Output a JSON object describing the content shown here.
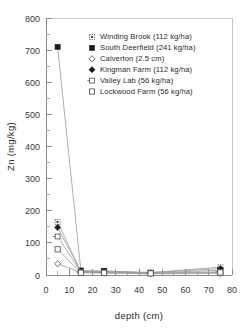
{
  "chart_data": {
    "type": "line",
    "title": "",
    "xlabel": "depth  (cm)",
    "ylabel": "Zn  (mg/kg)",
    "xlim": [
      0,
      80
    ],
    "ylim": [
      0,
      800
    ],
    "xticks": [
      0,
      10,
      20,
      30,
      40,
      50,
      60,
      70,
      80
    ],
    "yticks": [
      0,
      100,
      200,
      300,
      400,
      500,
      600,
      700,
      800
    ],
    "xtick_labels": [
      "0",
      "10",
      "20",
      "30",
      "40",
      "50",
      "60",
      "70",
      "80"
    ],
    "ytick_labels": [
      "0",
      "100",
      "200",
      "300",
      "400",
      "500",
      "600",
      "700",
      "800"
    ],
    "minor_ticks": true,
    "grid": false,
    "legend_position": "upper right inside",
    "x": [
      5,
      15,
      25,
      45,
      75
    ],
    "series": [
      {
        "name": "Winding Brook (112 kg/ha)",
        "marker": "dotted-square",
        "values": [
          165,
          10,
          12,
          8,
          24
        ]
      },
      {
        "name": "South Deerfield (241 kg/ha)",
        "marker": "filled-square",
        "values": [
          710,
          14,
          13,
          6,
          15
        ]
      },
      {
        "name": "Calverton (2.5 cm)",
        "marker": "open-diamond",
        "values": [
          35,
          8,
          6,
          4,
          5
        ]
      },
      {
        "name": "Kingman Farm (112 kg/ha)",
        "marker": "filled-diamond",
        "values": [
          148,
          11,
          10,
          7,
          20
        ]
      },
      {
        "name": "Valley Lab (56 kg/ha)",
        "marker": "open-square-dash",
        "values": [
          120,
          9,
          8,
          5,
          10
        ]
      },
      {
        "name": "Lockwood Farm (56 kg/ha)",
        "marker": "open-square",
        "values": [
          80,
          7,
          7,
          5,
          8
        ]
      }
    ]
  },
  "legend": {
    "entries": [
      {
        "label": "Winding Brook (112 kg/ha)"
      },
      {
        "label": "South Deerfield (241 kg/ha)"
      },
      {
        "label": "Calverton (2.5 cm)"
      },
      {
        "label": "Kingman Farm (112 kg/ha)"
      },
      {
        "label": "Valley Lab (56 kg/ha)"
      },
      {
        "label": "Lockwood Farm (56 kg/ha)"
      }
    ]
  },
  "axes": {
    "y_title": "Zn  (mg/kg)",
    "x_title": "depth  (cm)",
    "y_labels": [
      "800",
      "700",
      "600",
      "500",
      "400",
      "300",
      "200",
      "100",
      "0"
    ],
    "x_labels": [
      "0",
      "10",
      "20",
      "30",
      "40",
      "50",
      "60",
      "70",
      "80"
    ]
  },
  "colors": {
    "axis": "#8a8a8a",
    "line": "#9a9a9a",
    "marker_fill": "#1a1a1a",
    "marker_open": "#ffffff",
    "text": "#2a2a2a",
    "background": "#ffffff"
  }
}
